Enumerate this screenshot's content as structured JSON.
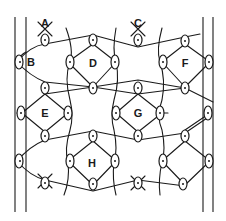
{
  "diagram": {
    "type": "lace-ground-pattern",
    "stroke_color": "#1a1a1a",
    "background": "#ffffff",
    "labels": [
      {
        "text": "A",
        "x": 45,
        "y": 27
      },
      {
        "text": "B",
        "x": 31,
        "y": 66
      },
      {
        "text": "C",
        "x": 138,
        "y": 27
      },
      {
        "text": "D",
        "x": 93,
        "y": 67
      },
      {
        "text": "E",
        "x": 45,
        "y": 117
      },
      {
        "text": "F",
        "x": 185,
        "y": 67
      },
      {
        "text": "G",
        "x": 138,
        "y": 117
      },
      {
        "text": "H",
        "x": 92,
        "y": 167
      }
    ],
    "border_lines": [
      {
        "x": 15,
        "y1": 17,
        "y2": 212
      },
      {
        "x": 26,
        "y1": 17,
        "y2": 212
      },
      {
        "x": 203,
        "y1": 17,
        "y2": 212
      },
      {
        "x": 213,
        "y1": 17,
        "y2": 212
      }
    ]
  }
}
